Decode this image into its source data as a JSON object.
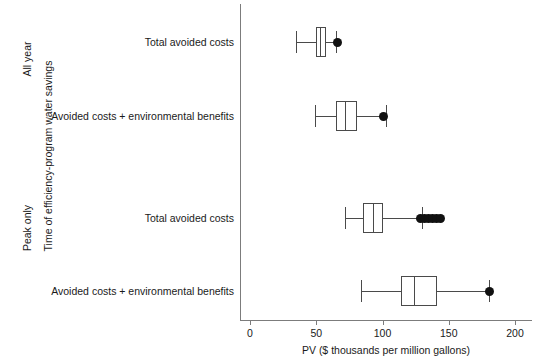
{
  "chart_data": {
    "type": "box",
    "title": "",
    "xlabel": "PV ($ thousands per million gallons)",
    "ylabel": "Time of efficiency-program water savings",
    "xlim": [
      0,
      200
    ],
    "xticks": [
      0,
      50,
      100,
      150,
      200
    ],
    "xticklabels": [
      "0",
      "50",
      "100",
      "150",
      "200"
    ],
    "grid": false,
    "legend": "none",
    "groups": [
      {
        "name": "All year",
        "categories": [
          {
            "label": "Total avoided costs",
            "whisker_low": 35,
            "q1": 50,
            "median": 53,
            "q3": 57,
            "whisker_high": 65,
            "outliers": [
              66
            ]
          },
          {
            "label": "Avoided costs + environmental benefits",
            "whisker_low": 49,
            "q1": 65,
            "median": 72,
            "q3": 81,
            "whisker_high": 103,
            "outliers": [
              101
            ]
          }
        ]
      },
      {
        "name": "Peak only",
        "categories": [
          {
            "label": "Total avoided costs",
            "whisker_low": 72,
            "q1": 85,
            "median": 93,
            "q3": 100,
            "whisker_high": 130,
            "outliers": [
              129,
              132,
              135,
              138,
              141,
              144
            ]
          },
          {
            "label": "Avoided costs + environmental benefits",
            "whisker_low": 84,
            "q1": 114,
            "median": 124,
            "q3": 141,
            "whisker_high": 180,
            "outliers": [
              181
            ]
          }
        ]
      }
    ]
  },
  "axis": {
    "y_title": "Time of efficiency-program water savings",
    "x_title": "PV ($ thousands per million gallons)",
    "group_labels": [
      "All year",
      "Peak only"
    ],
    "tick_labels": [
      "0",
      "50",
      "100",
      "150",
      "200"
    ],
    "category_labels": [
      "Total avoided costs",
      "Avoided costs + environmental benefits",
      "Total avoided costs",
      "Avoided costs + environmental benefits"
    ]
  },
  "style": {
    "box_stroke": "#4a4a4a",
    "box_fill": "#ffffff",
    "outlier_color": "#111111",
    "axis_color": "#7c7c7c",
    "text_color": "#1a1a1a"
  }
}
